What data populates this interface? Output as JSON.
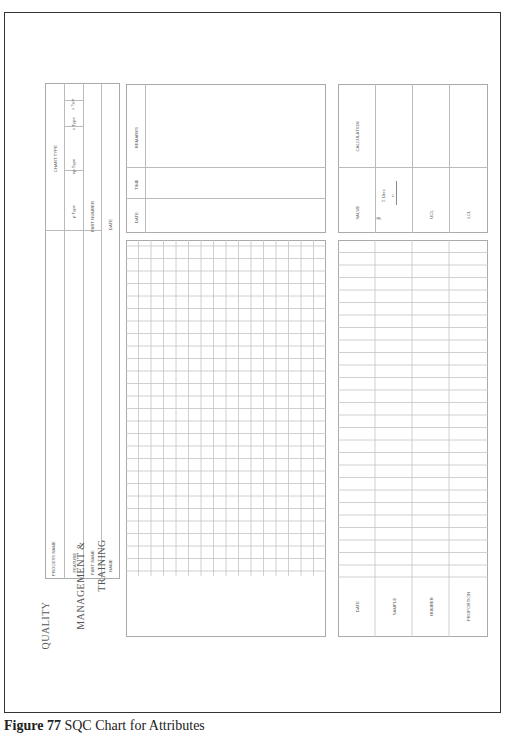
{
  "figure": {
    "number_label": "Figure 77",
    "title": "SQC Chart for Attributes"
  },
  "brand": {
    "line1": "QUALITY",
    "line2": "MANAGEMENT &",
    "line3": "TRAINING"
  },
  "header_fields": {
    "process_name": "PROCESS NAME",
    "feature": "FEATURE",
    "part_name": "PART NAME",
    "name": "NAME",
    "chart_type": "CHART TYPE",
    "p_type": "p Type",
    "np_type": "np Type",
    "c_type": "c Type",
    "u_type": "u Type",
    "part_number": "PART NUMBER",
    "date": "DATE"
  },
  "remarks_block": {
    "remarks": "REMARKS",
    "time": "TIME",
    "date": "DATE"
  },
  "calculation_block": {
    "calculation": "CALCULATION",
    "value": "VALUE",
    "p_bar": "p̄",
    "formula_numerator": "Σ  Dtec",
    "formula_denominator": "n",
    "ucl": "UCL",
    "lcl": "LCL"
  },
  "data_table": {
    "columns": [
      "DATE",
      "SAMPLE",
      "NUMBER",
      "PROPORTION"
    ],
    "row_count": 27
  },
  "plot_grid": {
    "columns": 16,
    "rows": 27
  }
}
